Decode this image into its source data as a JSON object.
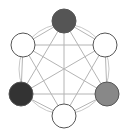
{
  "diagram": {
    "type": "complete-graph",
    "circle": {
      "cx": 64,
      "cy": 69,
      "r": 45,
      "stroke": "#c8c8c8"
    },
    "edge_color": "#b4b4b4",
    "node_radius": 12,
    "nodes": [
      {
        "id": "top",
        "x": 64,
        "y": 21,
        "fill": "#555555"
      },
      {
        "id": "upper-left",
        "x": 23,
        "y": 45,
        "fill": "#ffffff"
      },
      {
        "id": "upper-right",
        "x": 105,
        "y": 45,
        "fill": "#ffffff"
      },
      {
        "id": "lower-left",
        "x": 21,
        "y": 94,
        "fill": "#333333"
      },
      {
        "id": "lower-right",
        "x": 107,
        "y": 94,
        "fill": "#888888"
      },
      {
        "id": "bottom",
        "x": 64,
        "y": 116,
        "fill": "#ffffff"
      }
    ]
  }
}
